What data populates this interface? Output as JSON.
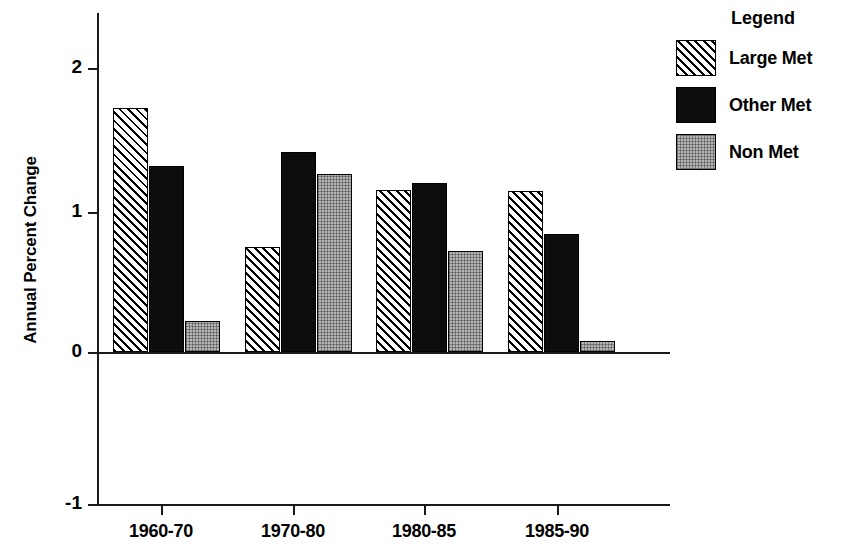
{
  "chart_data": {
    "type": "bar",
    "title": "",
    "xlabel": "",
    "ylabel": "Annual Percent Change",
    "categories": [
      "1960-70",
      "1970-80",
      "1980-85",
      "1985-90"
    ],
    "series": [
      {
        "name": "Large Met",
        "fill": "hatch",
        "values": [
          1.74,
          0.75,
          1.16,
          1.15
        ]
      },
      {
        "name": "Other Met",
        "fill": "solid",
        "values": [
          1.33,
          1.43,
          1.21,
          0.84
        ]
      },
      {
        "name": "Non Met",
        "fill": "gray",
        "values": [
          0.22,
          1.27,
          0.72,
          0.08
        ]
      }
    ],
    "ylim": [
      -1,
      2.4
    ],
    "yticks": [
      2,
      1,
      0,
      -1
    ],
    "ytick_labels": [
      "2",
      "1",
      "0",
      "-1"
    ],
    "grid": false,
    "legend_position": "right"
  },
  "legend": {
    "title": "Legend",
    "entries": [
      {
        "label": "Large Met",
        "swatch": "hatched-swatch"
      },
      {
        "label": "Other Met",
        "swatch": "black-swatch"
      },
      {
        "label": "Non Met",
        "swatch": "gray-swatch"
      }
    ]
  },
  "colors": {
    "axis": "#1a1a1a",
    "bar_outline": "#000000",
    "solid_fill": "#0d0d0d",
    "gray_fill": "#b5b5b5",
    "background": "#ffffff"
  }
}
